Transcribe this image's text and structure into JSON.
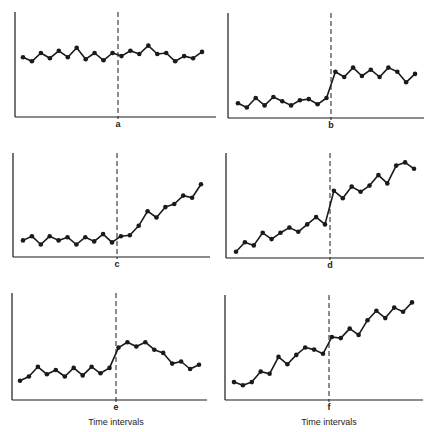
{
  "figure": {
    "xlabel": "Time intervals"
  },
  "chart_data": [
    {
      "type": "line",
      "panel": "a",
      "title": "",
      "xlabel": "a",
      "ylabel": "",
      "x": [
        1,
        2,
        3,
        4,
        5,
        6,
        7,
        8,
        9,
        10,
        11,
        12,
        13,
        14,
        15,
        16,
        17,
        18,
        19,
        20,
        21
      ],
      "values": [
        57,
        53,
        61,
        56,
        63,
        57,
        66,
        55,
        61,
        54,
        61,
        58,
        63,
        60,
        68,
        60,
        61,
        53,
        58,
        56,
        62
      ],
      "intervention_after_x": 11,
      "ylim": [
        0,
        100
      ],
      "grid": false,
      "description": "No change after intervention"
    },
    {
      "type": "line",
      "panel": "b",
      "title": "",
      "xlabel": "b",
      "ylabel": "",
      "x": [
        1,
        2,
        3,
        4,
        5,
        6,
        7,
        8,
        9,
        10,
        11,
        12,
        13,
        14,
        15,
        16,
        17,
        18,
        19,
        20,
        21
      ],
      "values": [
        14,
        10,
        19,
        12,
        20,
        16,
        12,
        17,
        18,
        13,
        19,
        44,
        39,
        48,
        40,
        46,
        39,
        48,
        44,
        34,
        42
      ],
      "intervention_after_x": 11,
      "ylim": [
        0,
        100
      ],
      "grid": false,
      "description": "Abrupt level change"
    },
    {
      "type": "line",
      "panel": "c",
      "title": "",
      "xlabel": "c",
      "ylabel": "",
      "x": [
        1,
        2,
        3,
        4,
        5,
        6,
        7,
        8,
        9,
        10,
        11,
        12,
        13,
        14,
        15,
        16,
        17,
        18,
        19,
        20,
        21
      ],
      "values": [
        16,
        20,
        12,
        20,
        16,
        19,
        12,
        19,
        15,
        22,
        14,
        20,
        21,
        30,
        44,
        38,
        48,
        51,
        59,
        57,
        70
      ],
      "intervention_after_x": 11,
      "ylim": [
        0,
        100
      ],
      "grid": false,
      "description": "Change in slope after intervention"
    },
    {
      "type": "line",
      "panel": "d",
      "title": "",
      "xlabel": "d",
      "ylabel": "",
      "x": [
        1,
        2,
        3,
        4,
        5,
        6,
        7,
        8,
        9,
        10,
        11,
        12,
        13,
        14,
        15,
        16,
        17,
        18,
        19,
        20,
        21
      ],
      "values": [
        6,
        15,
        12,
        24,
        18,
        24,
        29,
        25,
        32,
        39,
        32,
        64,
        57,
        68,
        63,
        69,
        79,
        71,
        88,
        91,
        85
      ],
      "intervention_after_x": 11,
      "ylim": [
        0,
        100
      ],
      "grid": false,
      "description": "Level shift on an existing trend"
    },
    {
      "type": "line",
      "panel": "e",
      "title": "",
      "xlabel": "e",
      "ylabel": "",
      "x": [
        1,
        2,
        3,
        4,
        5,
        6,
        7,
        8,
        9,
        10,
        11,
        12,
        13,
        14,
        15,
        16,
        17,
        18,
        19,
        20,
        21
      ],
      "values": [
        18,
        22,
        31,
        24,
        28,
        22,
        30,
        23,
        31,
        25,
        30,
        49,
        54,
        50,
        54,
        47,
        44,
        34,
        36,
        29,
        33
      ],
      "intervention_after_x": 11,
      "ylim": [
        0,
        100
      ],
      "grid": false,
      "description": "Temporary effect that decays"
    },
    {
      "type": "line",
      "panel": "f",
      "title": "",
      "xlabel": "f",
      "ylabel": "",
      "x": [
        1,
        2,
        3,
        4,
        5,
        6,
        7,
        8,
        9,
        10,
        11,
        12,
        13,
        14,
        15,
        16,
        17,
        18,
        19,
        20,
        21
      ],
      "values": [
        17,
        14,
        17,
        27,
        25,
        41,
        34,
        43,
        50,
        48,
        44,
        60,
        59,
        68,
        62,
        76,
        85,
        78,
        88,
        84,
        93
      ],
      "intervention_after_x": 11,
      "ylim": [
        0,
        100
      ],
      "grid": false,
      "description": "Continuing trend with small shift"
    }
  ]
}
